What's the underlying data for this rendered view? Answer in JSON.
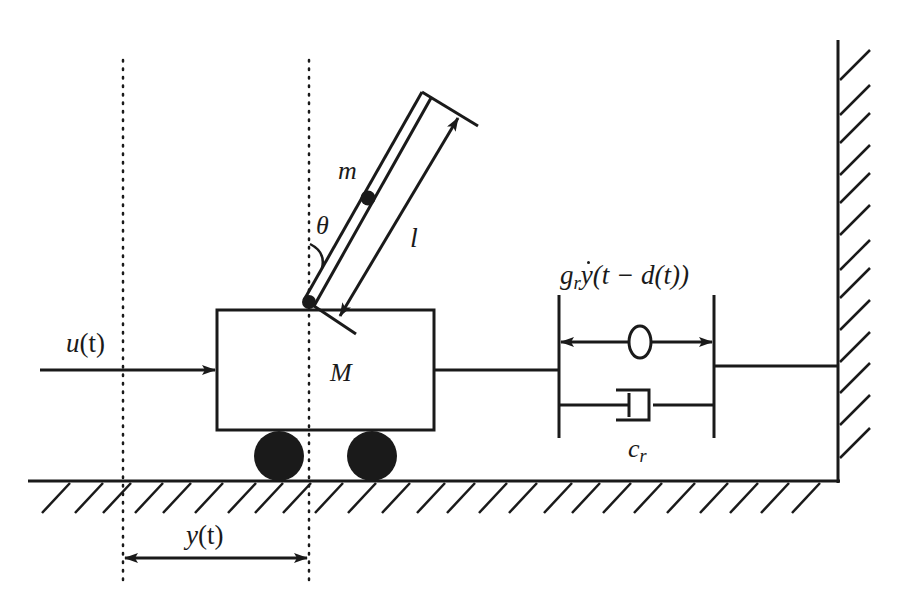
{
  "figure": {
    "colors": {
      "ink": "#1a1a1a",
      "background": "#ffffff"
    }
  },
  "labels": {
    "pendulum_mass": "m",
    "pendulum_angle": "θ",
    "pendulum_length": "l",
    "cart_mass": "M",
    "input_force": "u(t)",
    "input_force_fn": "u",
    "input_force_arg": "(t)",
    "displacement": "y(t)",
    "displacement_fn": "y",
    "displacement_arg": "(t)",
    "resonator_gain_base": "g",
    "resonator_gain_sub": "r",
    "resonator_expr_fn": "y",
    "resonator_expr_arg": "(t − d(t))",
    "damper_base": "c",
    "damper_sub": "r"
  },
  "components": [
    {
      "id": "ground",
      "type": "fixed-support",
      "orientation": "horizontal"
    },
    {
      "id": "wall",
      "type": "fixed-support",
      "orientation": "vertical"
    },
    {
      "id": "cart",
      "type": "mass-block",
      "label": "M"
    },
    {
      "id": "wheels",
      "type": "roller",
      "count": 2
    },
    {
      "id": "pendulum",
      "type": "rod",
      "label": "m",
      "length": "l",
      "angle": "θ"
    },
    {
      "id": "delayed-resonator",
      "type": "actuator",
      "label": "g_r ẏ(t−d(t))"
    },
    {
      "id": "damper",
      "type": "dashpot",
      "label": "c_r"
    },
    {
      "id": "reference-lines",
      "type": "dotted",
      "count": 2
    }
  ]
}
